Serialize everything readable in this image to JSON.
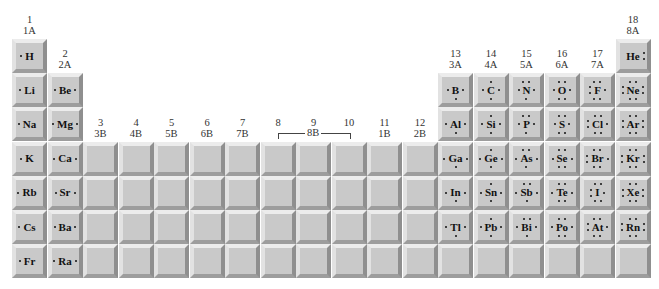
{
  "group_labels": [
    {
      "col": 1,
      "num": "1",
      "ab": "1A",
      "row": 0
    },
    {
      "col": 2,
      "num": "2",
      "ab": "2A",
      "row": 1
    },
    {
      "col": 3,
      "num": "3",
      "ab": "3B",
      "row": 3
    },
    {
      "col": 4,
      "num": "4",
      "ab": "4B",
      "row": 3
    },
    {
      "col": 5,
      "num": "5",
      "ab": "5B",
      "row": 3
    },
    {
      "col": 6,
      "num": "6",
      "ab": "6B",
      "row": 3
    },
    {
      "col": 7,
      "num": "7",
      "ab": "7B",
      "row": 3
    },
    {
      "col": 8,
      "num": "8",
      "ab": "",
      "row": 3
    },
    {
      "col": 9,
      "num": "9",
      "ab": "",
      "row": 3
    },
    {
      "col": 10,
      "num": "10",
      "ab": "",
      "row": 3
    },
    {
      "col": 11,
      "num": "11",
      "ab": "1B",
      "row": 3
    },
    {
      "col": 12,
      "num": "12",
      "ab": "2B",
      "row": 3
    },
    {
      "col": 13,
      "num": "13",
      "ab": "3A",
      "row": 1
    },
    {
      "col": 14,
      "num": "14",
      "ab": "4A",
      "row": 1
    },
    {
      "col": 15,
      "num": "15",
      "ab": "5A",
      "row": 1
    },
    {
      "col": 16,
      "num": "16",
      "ab": "6A",
      "row": 1
    },
    {
      "col": 17,
      "num": "17",
      "ab": "7A",
      "row": 1
    },
    {
      "col": 18,
      "num": "18",
      "ab": "8A",
      "row": 0
    }
  ],
  "bracket_8_10_label": "8B",
  "elements": [
    {
      "symbol": "H",
      "row": 1,
      "col": 1,
      "dots": {
        "t": 0,
        "r": 0,
        "b": 0,
        "l": 1
      }
    },
    {
      "symbol": "He",
      "row": 1,
      "col": 18,
      "dots": {
        "t": 0,
        "r": 2,
        "b": 0,
        "l": 0
      }
    },
    {
      "symbol": "Li",
      "row": 2,
      "col": 1,
      "dots": {
        "t": 0,
        "r": 0,
        "b": 0,
        "l": 1
      }
    },
    {
      "symbol": "Be",
      "row": 2,
      "col": 2,
      "dots": {
        "t": 0,
        "r": 1,
        "b": 0,
        "l": 1
      }
    },
    {
      "symbol": "B",
      "row": 2,
      "col": 13,
      "dots": {
        "t": 0,
        "r": 1,
        "b": 1,
        "l": 1
      }
    },
    {
      "symbol": "C",
      "row": 2,
      "col": 14,
      "dots": {
        "t": 1,
        "r": 1,
        "b": 1,
        "l": 1
      }
    },
    {
      "symbol": "N",
      "row": 2,
      "col": 15,
      "dots": {
        "t": 2,
        "r": 1,
        "b": 1,
        "l": 1
      }
    },
    {
      "symbol": "O",
      "row": 2,
      "col": 16,
      "dots": {
        "t": 2,
        "r": 1,
        "b": 2,
        "l": 1
      }
    },
    {
      "symbol": "F",
      "row": 2,
      "col": 17,
      "dots": {
        "t": 2,
        "r": 1,
        "b": 2,
        "l": 2
      }
    },
    {
      "symbol": "Ne",
      "row": 2,
      "col": 18,
      "dots": {
        "t": 2,
        "r": 2,
        "b": 2,
        "l": 2
      }
    },
    {
      "symbol": "Na",
      "row": 3,
      "col": 1,
      "dots": {
        "t": 0,
        "r": 0,
        "b": 0,
        "l": 1
      }
    },
    {
      "symbol": "Mg",
      "row": 3,
      "col": 2,
      "dots": {
        "t": 0,
        "r": 1,
        "b": 0,
        "l": 1
      }
    },
    {
      "symbol": "Al",
      "row": 3,
      "col": 13,
      "dots": {
        "t": 0,
        "r": 1,
        "b": 1,
        "l": 1
      }
    },
    {
      "symbol": "Si",
      "row": 3,
      "col": 14,
      "dots": {
        "t": 1,
        "r": 1,
        "b": 1,
        "l": 1
      }
    },
    {
      "symbol": "P",
      "row": 3,
      "col": 15,
      "dots": {
        "t": 2,
        "r": 1,
        "b": 1,
        "l": 1
      }
    },
    {
      "symbol": "S",
      "row": 3,
      "col": 16,
      "dots": {
        "t": 2,
        "r": 1,
        "b": 2,
        "l": 1
      }
    },
    {
      "symbol": "Cl",
      "row": 3,
      "col": 17,
      "dots": {
        "t": 2,
        "r": 1,
        "b": 2,
        "l": 2
      }
    },
    {
      "symbol": "Ar",
      "row": 3,
      "col": 18,
      "dots": {
        "t": 2,
        "r": 2,
        "b": 2,
        "l": 2
      }
    },
    {
      "symbol": "K",
      "row": 4,
      "col": 1,
      "dots": {
        "t": 0,
        "r": 0,
        "b": 0,
        "l": 1
      }
    },
    {
      "symbol": "Ca",
      "row": 4,
      "col": 2,
      "dots": {
        "t": 0,
        "r": 1,
        "b": 0,
        "l": 1
      }
    },
    {
      "symbol": "Ga",
      "row": 4,
      "col": 13,
      "dots": {
        "t": 0,
        "r": 1,
        "b": 1,
        "l": 1
      }
    },
    {
      "symbol": "Ge",
      "row": 4,
      "col": 14,
      "dots": {
        "t": 1,
        "r": 1,
        "b": 1,
        "l": 1
      }
    },
    {
      "symbol": "As",
      "row": 4,
      "col": 15,
      "dots": {
        "t": 2,
        "r": 1,
        "b": 1,
        "l": 1
      }
    },
    {
      "symbol": "Se",
      "row": 4,
      "col": 16,
      "dots": {
        "t": 2,
        "r": 1,
        "b": 2,
        "l": 1
      }
    },
    {
      "symbol": "Br",
      "row": 4,
      "col": 17,
      "dots": {
        "t": 2,
        "r": 1,
        "b": 2,
        "l": 2
      }
    },
    {
      "symbol": "Kr",
      "row": 4,
      "col": 18,
      "dots": {
        "t": 2,
        "r": 2,
        "b": 2,
        "l": 2
      }
    },
    {
      "symbol": "Rb",
      "row": 5,
      "col": 1,
      "dots": {
        "t": 0,
        "r": 0,
        "b": 0,
        "l": 1
      }
    },
    {
      "symbol": "Sr",
      "row": 5,
      "col": 2,
      "dots": {
        "t": 0,
        "r": 1,
        "b": 0,
        "l": 1
      }
    },
    {
      "symbol": "In",
      "row": 5,
      "col": 13,
      "dots": {
        "t": 0,
        "r": 1,
        "b": 1,
        "l": 1
      }
    },
    {
      "symbol": "Sn",
      "row": 5,
      "col": 14,
      "dots": {
        "t": 1,
        "r": 1,
        "b": 1,
        "l": 1
      }
    },
    {
      "symbol": "Sb",
      "row": 5,
      "col": 15,
      "dots": {
        "t": 2,
        "r": 1,
        "b": 1,
        "l": 1
      }
    },
    {
      "symbol": "Te",
      "row": 5,
      "col": 16,
      "dots": {
        "t": 2,
        "r": 1,
        "b": 2,
        "l": 1
      }
    },
    {
      "symbol": "I",
      "row": 5,
      "col": 17,
      "dots": {
        "t": 2,
        "r": 1,
        "b": 2,
        "l": 2
      }
    },
    {
      "symbol": "Xe",
      "row": 5,
      "col": 18,
      "dots": {
        "t": 2,
        "r": 2,
        "b": 2,
        "l": 2
      }
    },
    {
      "symbol": "Cs",
      "row": 6,
      "col": 1,
      "dots": {
        "t": 0,
        "r": 0,
        "b": 0,
        "l": 1
      }
    },
    {
      "symbol": "Ba",
      "row": 6,
      "col": 2,
      "dots": {
        "t": 0,
        "r": 1,
        "b": 0,
        "l": 1
      }
    },
    {
      "symbol": "Tl",
      "row": 6,
      "col": 13,
      "dots": {
        "t": 0,
        "r": 1,
        "b": 1,
        "l": 1
      }
    },
    {
      "symbol": "Pb",
      "row": 6,
      "col": 14,
      "dots": {
        "t": 1,
        "r": 1,
        "b": 1,
        "l": 1
      }
    },
    {
      "symbol": "Bi",
      "row": 6,
      "col": 15,
      "dots": {
        "t": 2,
        "r": 1,
        "b": 1,
        "l": 1
      }
    },
    {
      "symbol": "Po",
      "row": 6,
      "col": 16,
      "dots": {
        "t": 2,
        "r": 1,
        "b": 2,
        "l": 1
      }
    },
    {
      "symbol": "At",
      "row": 6,
      "col": 17,
      "dots": {
        "t": 2,
        "r": 1,
        "b": 2,
        "l": 2
      }
    },
    {
      "symbol": "Rn",
      "row": 6,
      "col": 18,
      "dots": {
        "t": 2,
        "r": 2,
        "b": 2,
        "l": 2
      }
    },
    {
      "symbol": "Fr",
      "row": 7,
      "col": 1,
      "dots": {
        "t": 0,
        "r": 0,
        "b": 0,
        "l": 1
      }
    },
    {
      "symbol": "Ra",
      "row": 7,
      "col": 2,
      "dots": {
        "t": 0,
        "r": 1,
        "b": 0,
        "l": 1
      }
    }
  ],
  "colors": {
    "cell": "#c9c9c9",
    "highlight": "#ececec",
    "shadow": "#8f8f8f",
    "text": "#111111"
  }
}
